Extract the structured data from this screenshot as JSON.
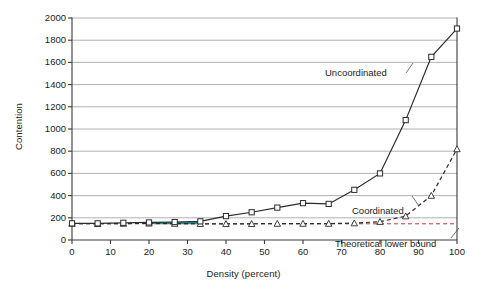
{
  "chart_data": {
    "type": "line",
    "title": "",
    "xlabel": "Density (percent)",
    "ylabel": "Contention",
    "xlim": [
      0,
      100
    ],
    "ylim": [
      0,
      2000
    ],
    "xticks": [
      0,
      10,
      20,
      30,
      40,
      50,
      60,
      70,
      80,
      90,
      100
    ],
    "yticks": [
      0,
      200,
      400,
      600,
      800,
      1000,
      1200,
      1400,
      1600,
      1800,
      2000
    ],
    "grid": "horizontal",
    "legend": "inline-annotations",
    "x": [
      0,
      6.67,
      13.33,
      20,
      26.67,
      33.33,
      40,
      46.67,
      53.33,
      60,
      66.67,
      73.33,
      80,
      86.67,
      93.33,
      100
    ],
    "series": [
      {
        "name": "Uncoordinated",
        "marker": "square",
        "linestyle": "solid",
        "color": "#2b2b2b",
        "values": [
          150,
          150,
          155,
          158,
          162,
          168,
          215,
          250,
          292,
          332,
          325,
          452,
          600,
          1080,
          1650,
          1905
        ]
      },
      {
        "name": "Coordinated",
        "marker": "triangle",
        "linestyle": "dashed",
        "color": "#2b2b2b",
        "values": [
          148,
          146,
          148,
          150,
          148,
          146,
          146,
          146,
          148,
          148,
          148,
          152,
          165,
          215,
          400,
          820
        ]
      },
      {
        "name": "Theoretical lower bound",
        "marker": "none",
        "linestyle": "dashed",
        "color": "#d4302f",
        "values": [
          146,
          146,
          146,
          146,
          146,
          146,
          146,
          146,
          146,
          146,
          146,
          146,
          146,
          146,
          146,
          146
        ]
      },
      {
        "name": "overlap-highlight",
        "marker": "none",
        "linestyle": "solid",
        "color": "#1f8f8f",
        "values": [
          null,
          null,
          null,
          152,
          152,
          152,
          null,
          null,
          null,
          null,
          null,
          null,
          null,
          null,
          null,
          null
        ]
      }
    ],
    "annotations": [
      {
        "label": "Uncoordinated",
        "x_px": 325,
        "y_px": 67
      },
      {
        "label": "Coordinated",
        "x_px": 352,
        "y_px": 205
      },
      {
        "label": "Theoretical lower bound",
        "x_px": 335,
        "y_px": 238
      }
    ]
  }
}
